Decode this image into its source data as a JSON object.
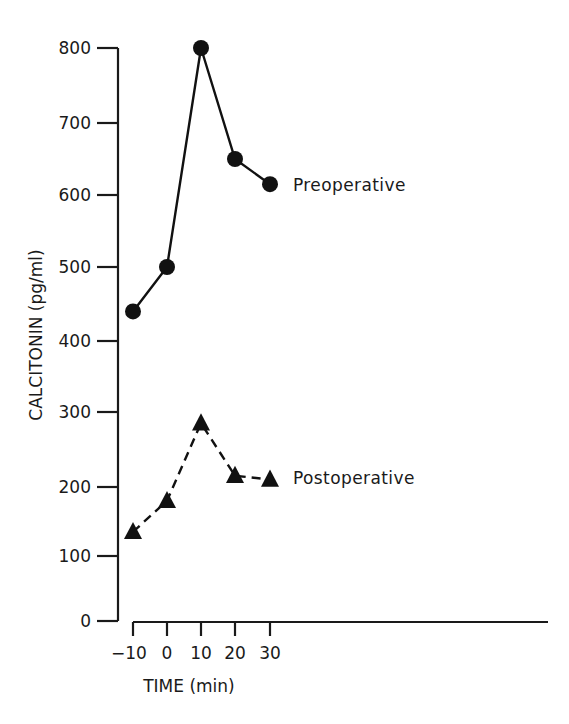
{
  "chart_data": {
    "type": "line",
    "title": "",
    "xlabel": "TIME (min)",
    "ylabel": "CALCITONIN (pg/ml)",
    "x": [
      -10,
      0,
      10,
      20,
      30
    ],
    "x_tick_labels": [
      "−10",
      "0",
      "10",
      "20",
      "30"
    ],
    "y_ticks": [
      0,
      100,
      200,
      300,
      400,
      500,
      600,
      700,
      800
    ],
    "y_tick_labels": [
      "0",
      "100",
      "200",
      "300",
      "400",
      "500",
      "600",
      "700",
      "800"
    ],
    "ylim": [
      0,
      800
    ],
    "xlim": [
      -10,
      30
    ],
    "grid": false,
    "legend_position": "inline labels at series end",
    "series": [
      {
        "name": "Preoperative",
        "marker": "circle",
        "line_style": "solid",
        "values": [
          440,
          500,
          800,
          650,
          615
        ]
      },
      {
        "name": "Postoperative",
        "marker": "triangle",
        "line_style": "dashed",
        "values": [
          135,
          180,
          285,
          215,
          210
        ]
      }
    ]
  },
  "labels": {
    "y_axis": "CALCITONIN (pg/ml)",
    "x_axis": "TIME (min)",
    "preoperative": "Preoperative",
    "postoperative": "Postoperative"
  },
  "colors": {
    "ink": "#1a1a1a",
    "background": "#ffffff"
  }
}
